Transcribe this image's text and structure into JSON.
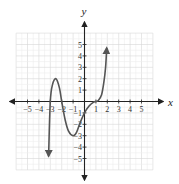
{
  "chart_data": {
    "type": "line",
    "title": "",
    "xlabel": "x",
    "ylabel": "y",
    "xlim": [
      -6,
      6
    ],
    "ylim": [
      -6,
      6
    ],
    "grid": true,
    "x_ticks": [
      -5,
      -4,
      -3,
      -2,
      -1,
      1,
      2,
      3,
      4,
      5
    ],
    "y_ticks": [
      -5,
      -4,
      -3,
      -2,
      -1,
      1,
      2,
      3,
      4,
      5
    ],
    "x_tick_labels": [
      "−5",
      "−4",
      "−3",
      "−2",
      "−1",
      "1",
      "2",
      "3",
      "4",
      "5"
    ],
    "y_tick_labels": [
      "−5",
      "−4",
      "−3",
      "−2",
      "−1",
      "1",
      "2",
      "3",
      "4",
      "5"
    ],
    "series": [
      {
        "name": "f(x)",
        "color": "#555555",
        "arrows": [
          "start",
          "end"
        ],
        "x": [
          -3.15,
          -3.0,
          -2.8,
          -2.5,
          -2.2,
          -2.0,
          -1.7,
          -1.4,
          -1.0,
          -0.7,
          -0.4,
          0.0,
          0.4,
          0.8,
          1.0,
          1.2,
          1.5,
          1.7,
          1.85,
          1.95
        ],
        "y": [
          -4.8,
          0.0,
          1.5,
          2.0,
          1.2,
          0.0,
          -1.6,
          -2.6,
          -3.0,
          -2.7,
          -1.9,
          -1.0,
          -0.4,
          -0.05,
          0.0,
          0.08,
          0.6,
          1.7,
          3.0,
          4.7
        ]
      }
    ],
    "key_points": {
      "x_intercepts": [
        -3,
        -2,
        1
      ],
      "y_intercept": -1,
      "local_max": [
        -2.5,
        2
      ],
      "local_min": [
        -1,
        -3
      ]
    }
  },
  "axes": {
    "x_label": "x",
    "y_label": "y"
  }
}
